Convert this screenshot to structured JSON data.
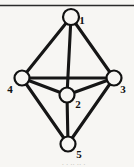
{
  "figure": {
    "background_color": "#f7f6f3",
    "ink_color": "#161616",
    "top_rule": {
      "x1": 0,
      "y1": 5.5,
      "x2": 134,
      "y2": 5.5
    },
    "caption_fragment": ". .  .. .. ."
  },
  "chart_data": {
    "type": "diagram",
    "title": "",
    "subtitle": "",
    "xlabel": "",
    "ylabel": "",
    "layout": "undirected graph, vertical bipyramid arrangement",
    "node_radius": 7.5,
    "nodes": [
      {
        "id": "1",
        "label": "1",
        "x": 71,
        "y": 17,
        "r": 8.0,
        "label_x": 82,
        "label_y": 24
      },
      {
        "id": "2",
        "label": "2",
        "x": 67,
        "y": 95,
        "r": 7.5,
        "label_x": 78,
        "label_y": 108
      },
      {
        "id": "3",
        "label": "3",
        "x": 114,
        "y": 78,
        "r": 7.5,
        "label_x": 123,
        "label_y": 93
      },
      {
        "id": "4",
        "label": "4",
        "x": 22,
        "y": 78,
        "r": 7.5,
        "label_x": 10,
        "label_y": 93
      },
      {
        "id": "5",
        "label": "5",
        "x": 68,
        "y": 144,
        "r": 7.5,
        "label_x": 79,
        "label_y": 158
      }
    ],
    "edges": [
      {
        "from": "1",
        "to": "4"
      },
      {
        "from": "1",
        "to": "3"
      },
      {
        "from": "1",
        "to": "2"
      },
      {
        "from": "4",
        "to": "3"
      },
      {
        "from": "4",
        "to": "2"
      },
      {
        "from": "2",
        "to": "3"
      },
      {
        "from": "4",
        "to": "5"
      },
      {
        "from": "2",
        "to": "5"
      },
      {
        "from": "3",
        "to": "5"
      }
    ],
    "edge_count": 9,
    "node_count": 5,
    "legend": [],
    "annotations": []
  }
}
